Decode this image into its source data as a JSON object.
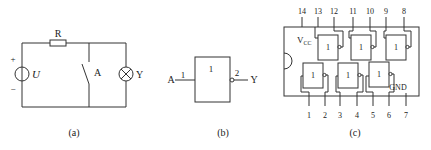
{
  "figure": {
    "panels": [
      {
        "id": "a",
        "caption": "(a)",
        "labels": {
          "resistor": "R",
          "source": "U",
          "plus": "+",
          "minus": "−",
          "switch": "A",
          "lamp": "Y"
        }
      },
      {
        "id": "b",
        "caption": "(b)",
        "labels": {
          "input": "A",
          "input_pin": "1",
          "gate_symbol": "1",
          "output_pin": "2",
          "output": "Y"
        }
      },
      {
        "id": "c",
        "caption": "(c)",
        "labels": {
          "vcc_main": "V",
          "vcc_sub": "CC",
          "gnd": "GND",
          "gate_symbol": "1"
        },
        "top_pins": [
          "14",
          "13",
          "12",
          "11",
          "10",
          "9",
          "8"
        ],
        "bottom_pins": [
          "1",
          "2",
          "3",
          "4",
          "5",
          "6",
          "7"
        ]
      }
    ]
  }
}
